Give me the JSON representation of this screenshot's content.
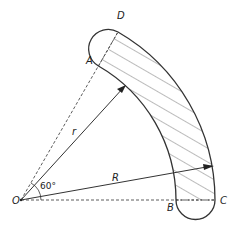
{
  "diagram": {
    "labels": {
      "O": "O",
      "A": "A",
      "B": "B",
      "C": "C",
      "D": "D",
      "r": "r",
      "R": "R",
      "angle": "60°"
    },
    "colors": {
      "stroke": "#333333",
      "hatch": "#555555",
      "background": "#ffffff"
    }
  }
}
